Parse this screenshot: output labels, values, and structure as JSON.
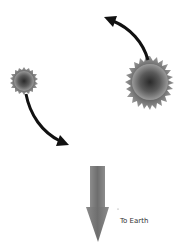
{
  "diagram": {
    "type": "binary-star-orbit",
    "bodies": [
      {
        "name": "large-star",
        "cx": 150,
        "cy": 82,
        "r": 24
      },
      {
        "name": "small-star",
        "cx": 24,
        "cy": 81,
        "r": 13
      }
    ],
    "orbit_arrows": [
      {
        "name": "large-star-orbit-arrow",
        "direction": "counterclockwise-up-left"
      },
      {
        "name": "small-star-orbit-arrow",
        "direction": "counterclockwise-down-right"
      }
    ],
    "direction_arrow": {
      "name": "to-earth-arrow",
      "direction": "down"
    },
    "labels": {
      "to_earth": "To Earth"
    },
    "colors": {
      "star_core": "#2a2a2a",
      "star_edge": "#8a8a8a",
      "orbit_arrow": "#111111",
      "earth_arrow": "#7a7a7a"
    }
  }
}
